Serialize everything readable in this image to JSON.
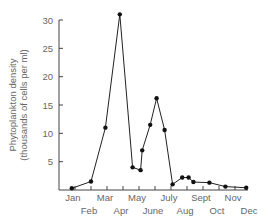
{
  "chart_data": {
    "type": "line",
    "title": "",
    "xlabel": "",
    "ylabel": "Phytoplankton density (thousands of cells per ml)",
    "ylabel_lines": [
      "Phytoplankton density",
      "(thousands of cells per ml)"
    ],
    "ylim": [
      0,
      30
    ],
    "yticks": [
      5,
      10,
      15,
      20,
      25,
      30
    ],
    "grid": false,
    "legend": null,
    "x_months": [
      "Jan",
      "Feb",
      "Mar",
      "Apr",
      "May",
      "June",
      "July",
      "Aug",
      "Sept",
      "Oct",
      "Nov",
      "Dec"
    ],
    "series": [
      {
        "name": "Phytoplankton density",
        "color": "#222222",
        "points": [
          {
            "x": 0.8,
            "y": 0.3
          },
          {
            "x": 2.0,
            "y": 1.5
          },
          {
            "x": 2.9,
            "y": 11.0
          },
          {
            "x": 3.8,
            "y": 31.0
          },
          {
            "x": 4.6,
            "y": 4.0
          },
          {
            "x": 5.1,
            "y": 3.5
          },
          {
            "x": 5.2,
            "y": 7.0
          },
          {
            "x": 5.7,
            "y": 11.5
          },
          {
            "x": 6.1,
            "y": 16.2
          },
          {
            "x": 6.6,
            "y": 10.6
          },
          {
            "x": 7.1,
            "y": 1.0
          },
          {
            "x": 7.7,
            "y": 2.2
          },
          {
            "x": 8.1,
            "y": 2.2
          },
          {
            "x": 8.4,
            "y": 1.4
          },
          {
            "x": 9.4,
            "y": 1.3
          },
          {
            "x": 10.4,
            "y": 0.6
          },
          {
            "x": 11.7,
            "y": 0.4
          }
        ]
      }
    ]
  }
}
